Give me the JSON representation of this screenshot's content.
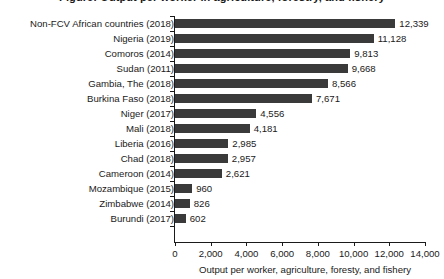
{
  "chart_data": {
    "type": "bar",
    "orientation": "horizontal",
    "title": "Figure: Output per worker in agriculture, forestry, and fishery",
    "title_cropped": true,
    "subtitle": "",
    "xlabel": "Output per worker, agriculture, foresty, and fishery",
    "ylabel": "",
    "xlim": [
      0,
      14000
    ],
    "ylim": null,
    "grid": false,
    "legend_position": "none",
    "bar_color": "#3a3a3a",
    "axis_color": "#1a1a1a",
    "background_color": "#ffffff",
    "xticks": [
      0,
      2000,
      4000,
      6000,
      8000,
      10000,
      12000,
      14000
    ],
    "xtick_labels": [
      "0",
      "2,000",
      "4,000",
      "6,000",
      "8,000",
      "10,000",
      "12,000",
      "14,000"
    ],
    "categories": [
      "Non-FCV African countries (2018)",
      "Nigeria (2019)",
      "Comoros (2014)",
      "Sudan (2011)",
      "Gambia, The (2018)",
      "Burkina Faso (2018)",
      "Niger (2017)",
      "Mali (2018)",
      "Liberia (2016)",
      "Chad (2018)",
      "Cameroon (2014)",
      "Mozambique (2015)",
      "Zimbabwe (2014)",
      "Burundi (2017)"
    ],
    "values": [
      12339,
      11128,
      9813,
      9668,
      8566,
      7671,
      4556,
      4181,
      2985,
      2957,
      2621,
      960,
      826,
      602
    ],
    "value_labels": [
      "12,339",
      "11,128",
      "9,813",
      "9,668",
      "8,566",
      "7,671",
      "4,556",
      "4,181",
      "2,985",
      "2,957",
      "2,621",
      "960",
      "826",
      "602"
    ]
  }
}
